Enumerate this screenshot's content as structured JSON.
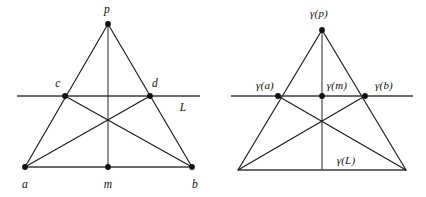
{
  "figure": {
    "stroke_color": "#1a1a1a",
    "line_color": "#3a3a3a",
    "background": "#ffffff"
  },
  "left_diagram": {
    "name": "triangle-with-secant-line",
    "labels": {
      "apex": "p",
      "left_intersection": "c",
      "right_intersection": "d",
      "base_left": "a",
      "base_mid": "m",
      "base_right": "b",
      "secant_line": "L"
    },
    "points": {
      "p": [
        108,
        24
      ],
      "c": [
        65,
        96
      ],
      "d": [
        150,
        96
      ],
      "a": [
        25,
        167
      ],
      "m": [
        108,
        167
      ],
      "b": [
        192,
        167
      ],
      "center": [
        108,
        127
      ]
    },
    "secant_extent": [
      17,
      200
    ],
    "label_positions": {
      "p": [
        107,
        10
      ],
      "c": [
        58,
        84
      ],
      "d": [
        155,
        84
      ],
      "a": [
        25,
        185
      ],
      "m": [
        108,
        185
      ],
      "b": [
        195,
        185
      ],
      "L": [
        183,
        108
      ]
    }
  },
  "right_diagram": {
    "name": "gamma-image-triangle-with-secant-line",
    "labels": {
      "apex": "γ(p)",
      "left_intersection": "γ(a)",
      "mid_point": "γ(m)",
      "right_intersection": "γ(b)",
      "base_line": "γ(L)"
    },
    "points": {
      "apex": [
        322,
        30
      ],
      "gamma_a": [
        278,
        96
      ],
      "gamma_m": [
        322,
        96
      ],
      "gamma_b": [
        365,
        96
      ],
      "base_left": [
        238,
        170
      ],
      "base_right": [
        406,
        170
      ],
      "center": [
        322,
        130
      ]
    },
    "secant_extent": [
      231,
      413
    ],
    "label_positions": {
      "apex": [
        319,
        13
      ],
      "gamma_a": [
        265,
        85
      ],
      "gamma_m": [
        337,
        85
      ],
      "gamma_b": [
        384,
        85
      ],
      "base_line": [
        346,
        160
      ]
    }
  }
}
